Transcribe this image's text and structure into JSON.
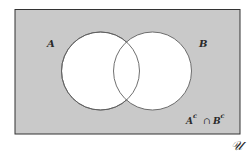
{
  "diagram": {
    "type": "venn",
    "universe": {
      "label": "𝒰",
      "fill": "#c9c9c9",
      "stroke": "#333333"
    },
    "sets": [
      {
        "label": "A",
        "fill": "#ffffff",
        "stroke": "#555555"
      },
      {
        "label": "B",
        "fill": "#ffffff",
        "stroke": "#555555"
      }
    ],
    "shaded_region": {
      "label_base_a": "A",
      "label_sup_a": "c",
      "label_op": "∩",
      "label_base_b": "B",
      "label_sup_b": "c",
      "description": "complement of A intersect complement of B"
    }
  }
}
